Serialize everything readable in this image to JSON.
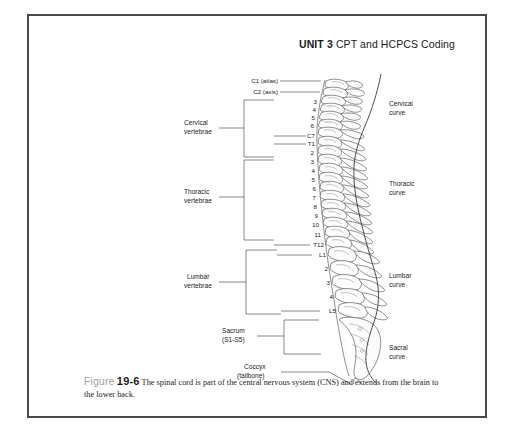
{
  "page": {
    "background": "#ffffff",
    "frame_color": "#4a4a4a"
  },
  "header": {
    "unit": "UNIT 3",
    "title": "CPT and HCPCS Coding"
  },
  "caption": {
    "figure_word": "Figure",
    "figure_number": "19-6",
    "text": "The spinal cord is part of the central nervous system (CNS) and extends from the brain to the lower back."
  },
  "figure": {
    "left_labels": [
      {
        "id": "cervical-vertebrae",
        "line1": "Cervical",
        "line2": "vertebrae"
      },
      {
        "id": "thoracic-vertebrae",
        "line1": "Thoracic",
        "line2": "vertebrae"
      },
      {
        "id": "lumbar-vertebrae",
        "line1": "Lumbar",
        "line2": "vertebrae"
      },
      {
        "id": "sacrum",
        "line1": "Sacrum",
        "line2": "(S1-S5)"
      },
      {
        "id": "coccyx",
        "line1": "Coccyx",
        "line2": "(tailbone)"
      }
    ],
    "right_labels": [
      {
        "id": "cervical-curve",
        "line1": "Cervical",
        "line2": "curve"
      },
      {
        "id": "thoracic-curve",
        "line1": "Thoracic",
        "line2": "curve"
      },
      {
        "id": "lumbar-curve",
        "line1": "Lumbar",
        "line2": "curve"
      },
      {
        "id": "sacral-curve",
        "line1": "Sacral",
        "line2": "curve"
      }
    ],
    "vertebrae_labels": {
      "cervical": [
        "C1 (atlas)",
        "C2 (axis)",
        "3",
        "4",
        "5",
        "6",
        "C7"
      ],
      "thoracic": [
        "T1",
        "2",
        "3",
        "4",
        "5",
        "6",
        "7",
        "8",
        "9",
        "10",
        "11",
        "T12"
      ],
      "lumbar": [
        "L1",
        "2",
        "3",
        "4",
        "L5"
      ]
    }
  }
}
